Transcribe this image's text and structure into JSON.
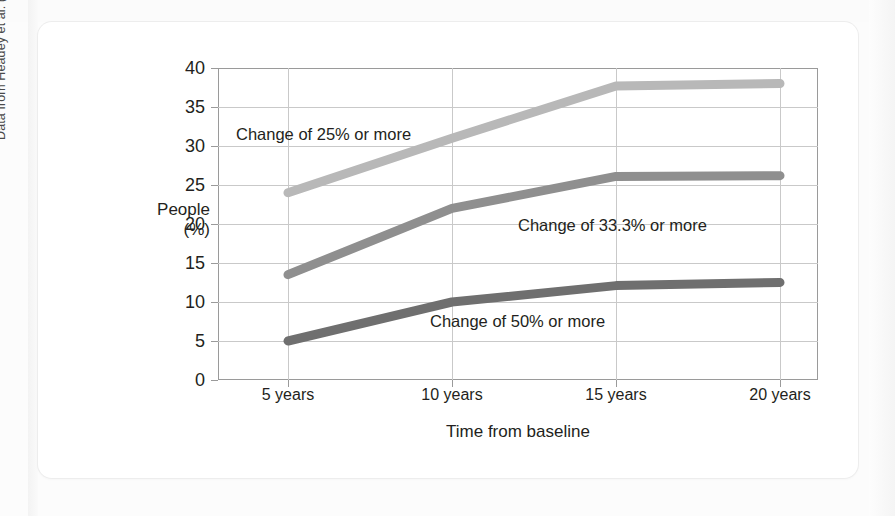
{
  "figure": {
    "source_credit": "Data from Headey et al. (2010)"
  },
  "chart_data": {
    "type": "line",
    "title": "",
    "xlabel": "Time from baseline",
    "ylabel": "People",
    "ylabel_unit": "(%)",
    "categories": [
      "5 years",
      "10 years",
      "15 years",
      "20 years"
    ],
    "x_values": [
      5,
      10,
      15,
      20
    ],
    "ylim": [
      0,
      40
    ],
    "y_ticks": [
      0,
      5,
      10,
      15,
      20,
      25,
      30,
      35,
      40
    ],
    "grid": "horizontal-and-vertical",
    "legend_position": "inline-annotations",
    "series": [
      {
        "name": "Change of 25% or more",
        "label": "Change of 25% or more",
        "color": "#b8b8b8",
        "values": [
          24.0,
          31.0,
          37.7,
          38.0
        ]
      },
      {
        "name": "Change of 33.3% or more",
        "label": "Change of 33.3% or more",
        "color": "#8f8f8f",
        "values": [
          13.5,
          22.0,
          26.1,
          26.2
        ]
      },
      {
        "name": "Change of 50% or more",
        "label": "Change of 50% or more",
        "color": "#6f6f6f",
        "values": [
          5.0,
          10.0,
          12.1,
          12.5
        ]
      }
    ]
  }
}
